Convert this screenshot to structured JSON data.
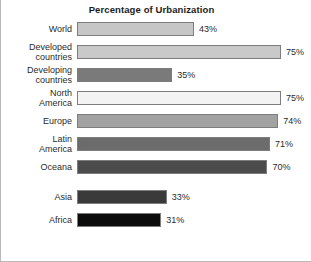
{
  "chart_data": {
    "type": "bar",
    "orientation": "horizontal",
    "title": "Percentage of Urbanization",
    "xlabel": "",
    "ylabel": "",
    "xlim": [
      0,
      80
    ],
    "grid": false,
    "legend": "none",
    "value_suffix": "%",
    "categories": [
      "World",
      "Developed countries",
      "Developing countries",
      "North America",
      "Europe",
      "Latin America",
      "Oceana",
      "Asia",
      "Africa"
    ],
    "values": [
      43,
      75,
      35,
      75,
      74,
      71,
      70,
      33,
      31
    ],
    "value_labels": [
      "43%",
      "75%",
      "35%",
      "75%",
      "74%",
      "71%",
      "70%",
      "33%",
      "31%"
    ],
    "bar_colors": [
      "#c6c6c6",
      "#c9c9c9",
      "#7a7a7a",
      "#f3f3f3",
      "#a2a2a2",
      "#6c6c6c",
      "#4c4c4c",
      "#3a3a3a",
      "#0b0b0b"
    ],
    "bar_border_color": "#7d7d7d"
  }
}
